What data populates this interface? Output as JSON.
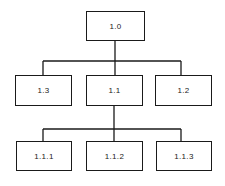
{
  "diagram": {
    "type": "hierarchy-tree",
    "nodes": [
      {
        "id": "1.0",
        "label": "1.0",
        "level": 0,
        "parent": null
      },
      {
        "id": "1.3",
        "label": "1.3",
        "level": 1,
        "parent": "1.0"
      },
      {
        "id": "1.1",
        "label": "1.1",
        "level": 1,
        "parent": "1.0"
      },
      {
        "id": "1.2",
        "label": "1.2",
        "level": 1,
        "parent": "1.0"
      },
      {
        "id": "1.1.1",
        "label": "1.1.1",
        "level": 2,
        "parent": "1.1"
      },
      {
        "id": "1.1.2",
        "label": "1.1.2",
        "level": 2,
        "parent": "1.1"
      },
      {
        "id": "1.1.3",
        "label": "1.1.3",
        "level": 2,
        "parent": "1.1"
      }
    ],
    "edges": [
      [
        "1.0",
        "1.3"
      ],
      [
        "1.0",
        "1.1"
      ],
      [
        "1.0",
        "1.2"
      ],
      [
        "1.1",
        "1.1.1"
      ],
      [
        "1.1",
        "1.1.2"
      ],
      [
        "1.1",
        "1.1.3"
      ]
    ],
    "line_color": "#1a1a1a"
  }
}
